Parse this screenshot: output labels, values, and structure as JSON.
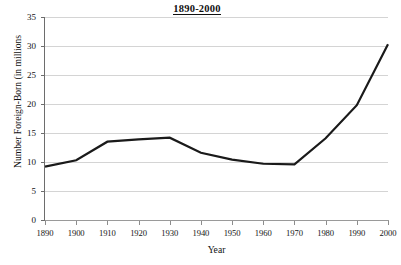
{
  "chart_data": {
    "type": "line",
    "title": "1890-2000",
    "xlabel": "Year",
    "ylabel": "Number Foreign-Born (in millions",
    "x": [
      1890,
      1900,
      1910,
      1920,
      1930,
      1940,
      1950,
      1960,
      1970,
      1980,
      1990,
      2000
    ],
    "categories": [
      "1890",
      "1900",
      "1910",
      "1920",
      "1930",
      "1940",
      "1950",
      "1960",
      "1970",
      "1980",
      "1990",
      "2000"
    ],
    "series": [
      {
        "name": "Foreign-Born Population",
        "values": [
          9.2,
          10.3,
          13.5,
          13.9,
          14.2,
          11.6,
          10.4,
          9.7,
          9.6,
          14.1,
          19.8,
          30.3
        ]
      }
    ],
    "xlim": [
      1890,
      2000
    ],
    "ylim": [
      0,
      35
    ],
    "y_ticks": [
      0,
      5,
      10,
      15,
      20,
      25,
      30,
      35
    ],
    "y_tick_labels": [
      "0",
      "5",
      "10",
      "15",
      "20",
      "25",
      "30",
      "35"
    ],
    "x_ticks": [
      1890,
      1900,
      1910,
      1920,
      1930,
      1940,
      1950,
      1960,
      1970,
      1980,
      1990,
      2000
    ],
    "grid": true,
    "grid_axis": "y",
    "legend": false,
    "legend_position": "none",
    "line_color": "#1a1a1a",
    "grid_color": "#d4d4d4",
    "axis_color": "#6d6d6d",
    "background_color": "#ffffff",
    "line_width": 2.2
  }
}
